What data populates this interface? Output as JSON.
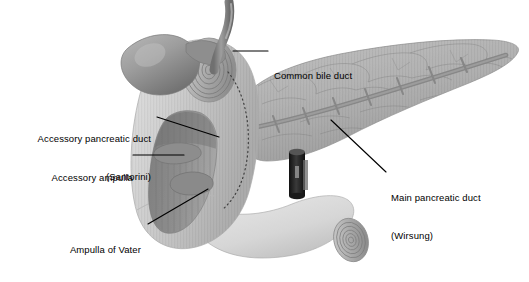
{
  "figure": {
    "background_color": "#ffffff",
    "label_color": "#000000",
    "leader_color": "#000000",
    "width": 529,
    "height": 282
  },
  "labels": [
    {
      "id": "common-bile-duct",
      "text": "Common bile duct",
      "lines": [
        "Common bile duct"
      ],
      "align": "left",
      "x": 273,
      "y": 45,
      "leader": "horizontal-left"
    },
    {
      "id": "accessory-pancreatic-duct",
      "text": "Accessory pancreatic duct (Santorini)",
      "lines": [
        "Accessory pancreatic duct",
        "(Santorini)"
      ],
      "align": "right",
      "x": 11,
      "y": 108,
      "leader": "diagonal-right-down"
    },
    {
      "id": "accessory-ampulla",
      "text": "Accessory ampulla",
      "lines": [
        "Accessory ampulla"
      ],
      "align": "right",
      "x": 44,
      "y": 146,
      "leader": "horizontal-right"
    },
    {
      "id": "ampulla-of-vater",
      "text": "Ampulla of Vater",
      "lines": [
        "Ampulla of Vater"
      ],
      "align": "right",
      "x": 59,
      "y": 219,
      "leader": "diagonal-right-up"
    },
    {
      "id": "main-pancreatic-duct",
      "text": "Main pancreatic duct (Wirsung)",
      "lines": [
        "Main pancreatic duct",
        "(Wirsung)"
      ],
      "align": "left",
      "x": 391,
      "y": 168,
      "leader": "diagonal-left-up"
    }
  ],
  "structures": [
    {
      "id": "gallbladder",
      "name": "Gallbladder",
      "fill": "#9a9a9a"
    },
    {
      "id": "common-bile-duct-tube",
      "name": "Common bile duct",
      "fill": "#8f8f8f"
    },
    {
      "id": "duodenum",
      "name": "Duodenum (C-loop)",
      "fill": "#cfcfcf"
    },
    {
      "id": "duodenum-cut-lumen",
      "name": "Opened duodenal lumen",
      "fill": "#8c8c8c"
    },
    {
      "id": "duodenal-stump-upper",
      "name": "Proximal duodenal cut end",
      "fill": "#a8a8a8"
    },
    {
      "id": "duodenal-stump-lower",
      "name": "Distal duodenal cut end",
      "fill": "#bdbdbd"
    },
    {
      "id": "pancreas",
      "name": "Pancreas (head, body, tail)",
      "fill": "#b4b4b4"
    },
    {
      "id": "main-duct",
      "name": "Main pancreatic duct (Wirsung)",
      "fill": "#8a8a8a"
    },
    {
      "id": "accessory-duct",
      "name": "Accessory pancreatic duct (Santorini)",
      "fill": "#9b9b9b"
    },
    {
      "id": "stent",
      "name": "Endoscopic stent / cannula",
      "fill": "#2a2a2a"
    },
    {
      "id": "boundary-dots",
      "name": "Dotted pancreas-duodenum boundary",
      "fill": "#4a4a4a"
    }
  ]
}
